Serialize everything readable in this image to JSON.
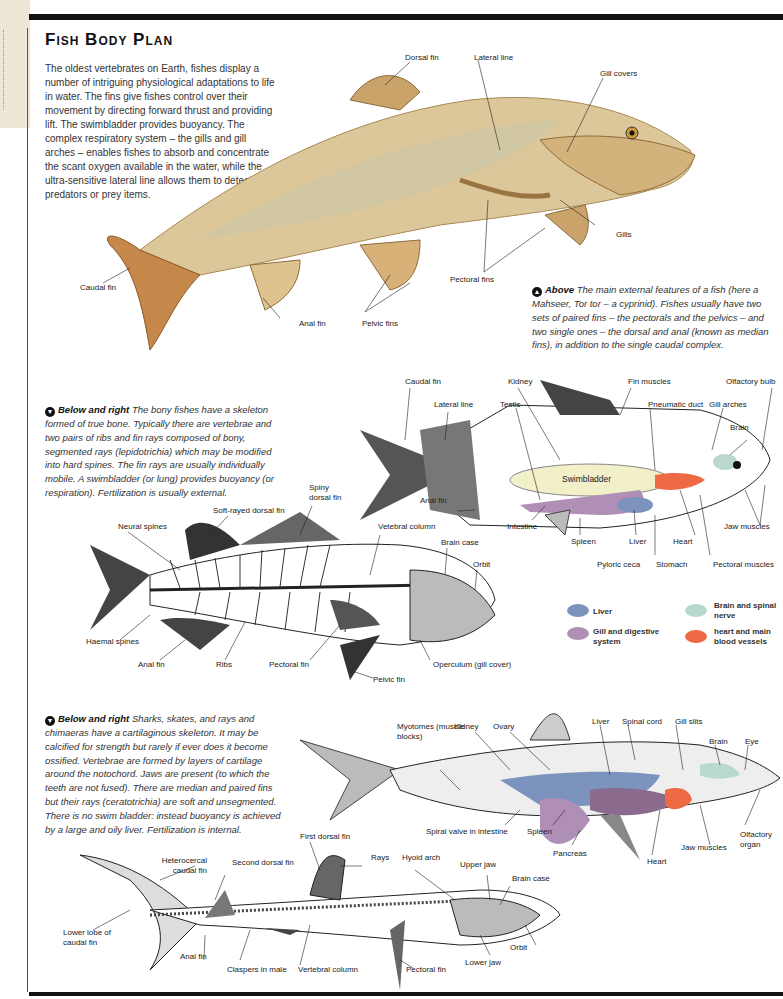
{
  "page": {
    "title": "Fish Body Plan",
    "intro": "The oldest vertebrates on Earth, fishes display a number of intriguing physiological adaptations to life in water. The fins give fishes control over their movement by directing forward thrust and providing lift. The swimbladder provides buoyancy. The complex respiratory system – the gills and gill arches – enables fishes to absorb and concentrate the scant oxygen available in the water, while the ultra-sensitive lateral line allows them to detect predators or prey items."
  },
  "captions": {
    "above": {
      "icon": "arrow-up-icon",
      "lead": "Above",
      "text": "The main external features of a fish (here a Mahseer, Tor tor – a cyprinid). Fishes usually have two sets of paired fins – the pectorals and the pelvics – and two single ones – the dorsal and anal (known as median fins), in addition to the single caudal complex."
    },
    "bony": {
      "icon": "arrow-down-icon",
      "lead": "Below and right",
      "text": "The bony fishes have a skeleton formed of true bone. Typically there are vertebrae and two pairs of ribs and fin rays composed of bony, segmented rays (lepidotrichia) which may be modified into hard spines. The fin rays are usually individually mobile. A swimbladder (or lung) provides buoyancy (or respiration). Fertilization is usually external."
    },
    "cartilaginous": {
      "icon": "arrow-down-icon",
      "lead": "Below and right",
      "text": "Sharks, skates, and rays and chimaeras have a cartilaginous skeleton. It may be calcified for strength but rarely if ever does it become ossified. Vertebrae are formed by layers of cartilage around the notochord. Jaws are present (to which the teeth are not fused). There are median and paired fins but their rays (ceratotrichia) are soft and unsegmented. There is no swim bladder: instead buoyancy is achieved by a large and oily liver. Fertilization is internal."
    }
  },
  "carp_labels": {
    "dorsal_fin": "Dorsal fin",
    "lateral_line": "Lateral line",
    "gill_covers": "Gill covers",
    "gills": "Gills",
    "pectoral_fins": "Pectoral fins",
    "caudal_fin": "Caudal fin",
    "anal_fin": "Anal fin",
    "pelvic_fins": "Pelvic fins"
  },
  "anatomy_labels": {
    "caudal_fin": "Caudal fin",
    "lateral_line": "Lateral line",
    "kidney": "Kidney",
    "testis": "Testis",
    "fin_muscles": "Fin muscles",
    "pneumatic_duct": "Pneumatic duct",
    "gill_arches": "Gill arches",
    "olfactory_bulb": "Olfactory bulb",
    "brain": "Brain",
    "swimbladder": "Swimbladder",
    "anal_fin": "Anal fin",
    "intestine": "Intestine",
    "spleen": "Spleen",
    "liver": "Liver",
    "heart": "Heart",
    "jaw_muscles": "Jaw muscles",
    "pyloric_ceca": "Pyloric ceca",
    "stomach": "Stomach",
    "pectoral_muscles": "Pectoral muscles"
  },
  "skeleton_labels": {
    "spiny_dorsal_fin": "Spiny dorsal fin",
    "soft_rayed_dorsal_fin": "Soft-rayed dorsal fin",
    "neural_spines": "Neural spines",
    "vertebral_column": "Vetebral column",
    "brain_case": "Brain case",
    "orbit": "Orbit",
    "haemal_spines": "Haemal spines",
    "anal_fin": "Anal fin",
    "ribs": "Ribs",
    "pectoral_fin": "Pectoral fin",
    "operculum": "Operculum (gill cover)",
    "pelvic_fin": "Pelvic fin"
  },
  "legend": [
    {
      "label": "Liver",
      "color": "#7b93bd"
    },
    {
      "label": "Gill and digestive system",
      "color": "#b08fb6"
    },
    {
      "label": "Brain and spinal nerve",
      "color": "#b9d9cc"
    },
    {
      "label": "heart and main blood vessels",
      "color": "#ee6a45"
    }
  ],
  "shark_labels": {
    "myotomes": "Myotomes (muscle blocks)",
    "kidney": "Kidney",
    "ovary": "Ovary",
    "liver": "Liver",
    "spinal_cord": "Spinal cord",
    "gill_slits": "Gill slits",
    "brain": "Brain",
    "eye": "Eye",
    "spiral_valve": "Spiral valve in intestine",
    "spleen": "Spleen",
    "pancreas": "Pancreas",
    "heart": "Heart",
    "jaw_muscles": "Jaw muscles",
    "olfactory_organ": "Olfactory organ"
  },
  "shark_skeleton_labels": {
    "first_dorsal_fin": "First dorsal fin",
    "rays": "Rays",
    "hyoid_arch": "Hyoid arch",
    "upper_jaw": "Upper jaw",
    "brain_case": "Brain case",
    "heterocercal": "Heterocercal caudal fin",
    "second_dorsal_fin": "Second dorsal fin",
    "lower_lobe": "Lower lobe of caudal fin",
    "anal_fin": "Anal fin",
    "claspers": "Claspers in male",
    "vertebral_column": "Vertebral column",
    "pectoral_fin": "Pectoral fin",
    "lower_jaw": "Lower jaw",
    "orbit": "Orbit"
  }
}
